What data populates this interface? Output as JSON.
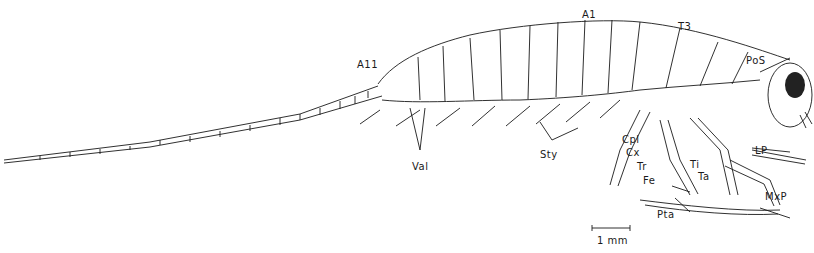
{
  "diagram": {
    "labels": {
      "A1": "A1",
      "T3": "T3",
      "PoS": "PoS",
      "A11": "A11",
      "Val": "Val",
      "Sty": "Sty",
      "Cpl": "Cpl",
      "Cx": "Cx",
      "Tr": "Tr",
      "Fe": "Fe",
      "Ti": "Ti",
      "Ta": "Ta",
      "LP": "LP",
      "MxP": "MxP",
      "Pta": "Pta"
    },
    "scale_bar": {
      "label": "1 mm"
    }
  }
}
